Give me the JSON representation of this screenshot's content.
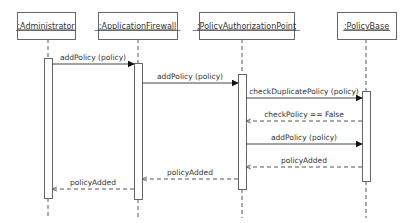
{
  "diagram": {
    "type": "sequence",
    "colors": {
      "line": "#555555",
      "text": "#333333",
      "box_border": "#666666",
      "background": "#ffffff"
    },
    "objects": [
      {
        "id": "admin",
        "label": ":Administrator",
        "box": [
          17,
          12,
          58,
          27
        ],
        "x": 48,
        "activation": [
          58,
          198
        ]
      },
      {
        "id": "fw",
        "label": ":ApplicationFirewall",
        "box": [
          98,
          12,
          79,
          27
        ],
        "x": 138,
        "activation": [
          63,
          199
        ]
      },
      {
        "id": "pap",
        "label": ":PolicyAuthorizationPoint",
        "box": [
          199,
          12,
          95,
          27
        ],
        "x": 242,
        "activation": [
          74,
          189
        ]
      },
      {
        "id": "pb",
        "label": ":PolicyBase",
        "box": [
          337,
          12,
          59,
          27
        ],
        "x": 366,
        "activation": [
          91,
          181
        ]
      }
    ],
    "messages": [
      {
        "from": "admin",
        "to": "fw",
        "label": "addPolicy (policy)",
        "y": 64,
        "kind": "call"
      },
      {
        "from": "fw",
        "to": "pap",
        "label": "addPolicy (policy)",
        "y": 83,
        "kind": "call"
      },
      {
        "from": "pap",
        "to": "pb",
        "label": "checkDuplicatePolicy (policy)",
        "y": 98,
        "kind": "call"
      },
      {
        "from": "pb",
        "to": "pap",
        "label": "checkPolicy == False",
        "y": 121,
        "kind": "return"
      },
      {
        "from": "pap",
        "to": "pb",
        "label": "addPolicy (policy)",
        "y": 144,
        "kind": "call"
      },
      {
        "from": "pb",
        "to": "pap",
        "label": "policyAdded",
        "y": 167,
        "kind": "return"
      },
      {
        "from": "pap",
        "to": "fw",
        "label": "policyAdded",
        "y": 179,
        "kind": "return"
      },
      {
        "from": "fw",
        "to": "admin",
        "label": "policyAdded",
        "y": 189,
        "kind": "return"
      }
    ]
  }
}
